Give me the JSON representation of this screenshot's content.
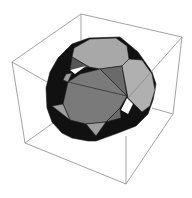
{
  "figure": {
    "kind": "3D polyhedron plot in bounding box",
    "colors": {
      "background": "#ffffff",
      "box_edges": "#8a8a8a",
      "face_light": "#a9a9a9",
      "face_mid": "#7d7d7d",
      "face_dark": "#5c5c5c",
      "face_shadow": "#111111",
      "face_outline": "#1a1a1a"
    }
  }
}
